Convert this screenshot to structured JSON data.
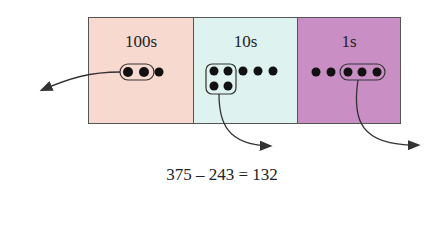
{
  "columns": [
    {
      "label": "100s",
      "color": "#f7d9d0",
      "digit": 3,
      "taken": 2
    },
    {
      "label": "10s",
      "color": "#def2f0",
      "digit": 7,
      "taken": 4
    },
    {
      "label": "1s",
      "color": "#c98fc4",
      "digit": 5,
      "taken": 3
    }
  ],
  "equation": "375 – 243 = 132"
}
